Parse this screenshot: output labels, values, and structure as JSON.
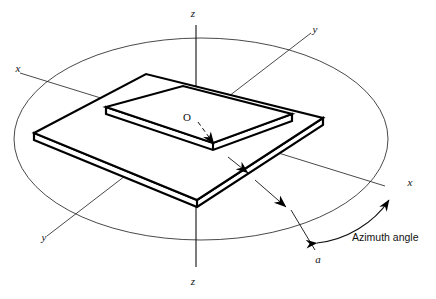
{
  "figure": {
    "labels": {
      "z_top": "z",
      "z_bottom": "z",
      "x_left": "x",
      "x_right": "x",
      "y_upper": "y",
      "y_lower": "y",
      "origin": "O",
      "dimension_a": "a",
      "azimuth": "Azimuth angle"
    },
    "colors": {
      "ink": "#000000",
      "thin_line": "#1a1a1a",
      "background": "#ffffff"
    },
    "geometry": {
      "origin_px": [
        196,
        120
      ],
      "ellipse": {
        "cx": 201,
        "cy": 139,
        "rx": 187,
        "ry": 101
      },
      "axes": {
        "z": {
          "from": [
            196,
            25
          ],
          "to": [
            196,
            267
          ]
        },
        "x": {
          "from": [
            20,
            73
          ],
          "to": [
            385,
            186
          ]
        },
        "y": {
          "from": [
            47,
            236
          ],
          "to": [
            311,
            33
          ]
        }
      },
      "upper_plate_top": [
        [
          106,
          107
        ],
        [
          183,
          86
        ],
        [
          292,
          114
        ],
        [
          213,
          143
        ]
      ],
      "lower_plate_top": [
        [
          34,
          133
        ],
        [
          146,
          74
        ],
        [
          323,
          118
        ],
        [
          197,
          200
        ]
      ],
      "plate_thickness_px": 7
    }
  }
}
